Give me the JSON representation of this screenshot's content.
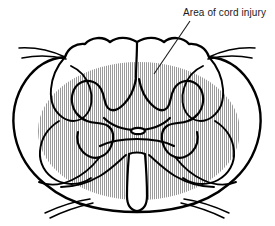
{
  "figure": {
    "background_color": "#ffffff",
    "line_color": "#000000",
    "width": 275,
    "height": 226
  },
  "annotations": [
    {
      "id": "area-of-cord-injury",
      "label": "Area of cord injury",
      "text_x": 183,
      "text_y": 16,
      "leader_from_x": 190,
      "leader_from_y": 21,
      "leader_to_x": 154,
      "leader_to_y": 74,
      "text_color": "#1a1a1a",
      "font_size": 10
    }
  ],
  "shading": {
    "name": "injury-shading",
    "description": "Vertical hatch fill marking the damaged region of the cord",
    "pattern": "vertical-hatch",
    "hatch_color": "#9a9a9a",
    "hatch_spacing_px": 2,
    "hatch_line_width_px": 1,
    "ellipse_center_x": 139,
    "ellipse_center_y": 131,
    "ellipse_radius_x": 101,
    "ellipse_radius_y": 69
  },
  "structures": [
    {
      "name": "outer-cord-outline",
      "label": "Spinal cord outer margin"
    },
    {
      "name": "posterior-median-sulcus",
      "label": "Posterior median sulcus"
    },
    {
      "name": "gray-matter-butterfly",
      "label": "Gray matter (butterfly)"
    },
    {
      "name": "central-canal",
      "label": "Central canal"
    },
    {
      "name": "anterior-median-fissure",
      "label": "Anterior median fissure"
    },
    {
      "name": "dorsal-rootlets-left",
      "label": "Dorsal rootlets (left)"
    },
    {
      "name": "dorsal-rootlets-right",
      "label": "Dorsal rootlets (right)"
    },
    {
      "name": "ventral-rootlets-left",
      "label": "Ventral rootlets (left)"
    },
    {
      "name": "ventral-rootlets-right",
      "label": "Ventral rootlets (right)"
    }
  ]
}
